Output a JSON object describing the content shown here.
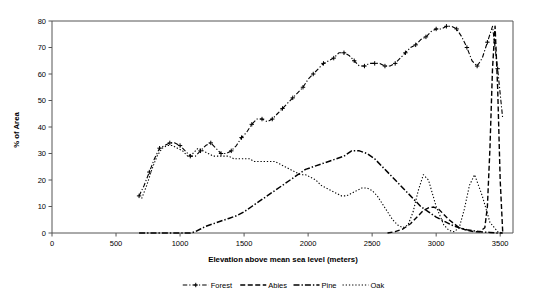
{
  "chart_data": {
    "type": "line",
    "title": "",
    "xlabel": "Elevation above mean sea level (meters)",
    "ylabel": "% of Area",
    "xlim": [
      0,
      3600
    ],
    "ylim": [
      0,
      80
    ],
    "xticks": [
      0,
      500,
      1000,
      1500,
      2000,
      2500,
      3000,
      3500
    ],
    "yticks": [
      0,
      10,
      20,
      30,
      40,
      50,
      60,
      70,
      80
    ],
    "xtick_labels": [
      "0",
      "500",
      "1000",
      "1500",
      "2000",
      "2500",
      "3000",
      "3500"
    ],
    "ytick_labels": [
      "0",
      "10",
      "20",
      "30",
      "40",
      "50",
      "60",
      "70",
      "80"
    ],
    "grid": false,
    "legend_position": "bottom",
    "series": [
      {
        "name": "Forest",
        "style": "dash-dot-marker",
        "marker": "plus",
        "color": "#000000",
        "x": [
          680,
          720,
          760,
          800,
          840,
          880,
          920,
          960,
          1000,
          1040,
          1080,
          1120,
          1160,
          1200,
          1240,
          1280,
          1320,
          1360,
          1400,
          1440,
          1480,
          1520,
          1560,
          1600,
          1640,
          1680,
          1720,
          1760,
          1800,
          1840,
          1880,
          1920,
          1960,
          2000,
          2040,
          2080,
          2120,
          2160,
          2200,
          2240,
          2280,
          2320,
          2360,
          2400,
          2440,
          2480,
          2520,
          2560,
          2600,
          2640,
          2680,
          2720,
          2760,
          2800,
          2840,
          2880,
          2920,
          2960,
          3000,
          3040,
          3080,
          3120,
          3160,
          3200,
          3240,
          3280,
          3320,
          3360,
          3400,
          3440,
          3480,
          3520
        ],
        "y": [
          14,
          18,
          23,
          28,
          32,
          33,
          34,
          34,
          33,
          31,
          29,
          29,
          31,
          33,
          34,
          32,
          30,
          30,
          31,
          33,
          36,
          38,
          41,
          43,
          43,
          42,
          43,
          45,
          47,
          49,
          51,
          53,
          55,
          58,
          60,
          62,
          64,
          65,
          66,
          68,
          68,
          67,
          65,
          63,
          63,
          64,
          64,
          64,
          63,
          63,
          64,
          66,
          68,
          70,
          71,
          73,
          74,
          76,
          77,
          77,
          78,
          78,
          77,
          74,
          70,
          65,
          63,
          66,
          72,
          78,
          62,
          43
        ]
      },
      {
        "name": "Abies",
        "style": "dashed",
        "color": "#000000",
        "x": [
          2620,
          2680,
          2740,
          2800,
          2860,
          2900,
          2940,
          2980,
          3020,
          3060,
          3100,
          3140,
          3180,
          3240,
          3300,
          3340,
          3380,
          3400,
          3420,
          3440,
          3460,
          3480,
          3500,
          3520
        ],
        "y": [
          0,
          0.5,
          1.5,
          3.5,
          6.5,
          8.5,
          9.5,
          9.8,
          9,
          7,
          5,
          3.5,
          2,
          1,
          0.5,
          0.5,
          2,
          10,
          32,
          62,
          78,
          55,
          20,
          0
        ]
      },
      {
        "name": "Pine",
        "style": "dash-dot",
        "color": "#000000",
        "x": [
          680,
          760,
          840,
          920,
          1000,
          1080,
          1120,
          1160,
          1200,
          1260,
          1320,
          1380,
          1440,
          1500,
          1560,
          1620,
          1680,
          1740,
          1800,
          1860,
          1920,
          1980,
          2040,
          2100,
          2160,
          2220,
          2280,
          2340,
          2400,
          2460,
          2520,
          2580,
          2640,
          2700,
          2760,
          2820,
          2880,
          2940,
          3000,
          3060,
          3120,
          3180,
          3240,
          3300,
          3360,
          3420,
          3480,
          3520
        ],
        "y": [
          0,
          0,
          0,
          0,
          0,
          0,
          0.5,
          1.5,
          2.5,
          3.5,
          4.5,
          5.5,
          6.5,
          8,
          10,
          12,
          14,
          16,
          18,
          20,
          22,
          24,
          25,
          26,
          27,
          28,
          29,
          31,
          31,
          30,
          28,
          25,
          22,
          19,
          16,
          13,
          10,
          8,
          6,
          4.5,
          3,
          2,
          1.2,
          0.8,
          0.4,
          0.2,
          0,
          0
        ]
      },
      {
        "name": "Oak",
        "style": "dotted",
        "color": "#000000",
        "x": [
          700,
          740,
          780,
          820,
          860,
          900,
          940,
          980,
          1020,
          1060,
          1100,
          1140,
          1180,
          1220,
          1260,
          1300,
          1340,
          1380,
          1420,
          1460,
          1500,
          1540,
          1580,
          1620,
          1660,
          1700,
          1740,
          1780,
          1820,
          1860,
          1900,
          1940,
          1980,
          2020,
          2060,
          2100,
          2140,
          2180,
          2220,
          2260,
          2300,
          2340,
          2380,
          2420,
          2460,
          2500,
          2540,
          2580,
          2620,
          2660,
          2700,
          2740,
          2780,
          2820,
          2860,
          2900,
          2940,
          3000,
          3060,
          3100,
          3140,
          3180,
          3220,
          3260,
          3300,
          3360,
          3420,
          3480,
          3520
        ],
        "y": [
          13,
          18,
          24,
          29,
          32,
          33,
          33,
          32,
          31,
          29,
          30,
          32,
          31,
          30,
          29,
          29,
          29,
          29,
          28,
          28,
          28,
          28,
          27,
          27,
          27,
          27,
          27,
          26,
          25,
          24,
          23,
          22,
          22,
          21,
          20,
          18,
          17,
          16,
          15,
          14,
          14,
          15,
          16,
          17,
          17,
          16,
          14,
          11,
          8,
          5,
          3,
          2,
          3,
          8,
          16,
          22,
          20,
          10,
          3,
          1,
          0.5,
          2,
          9,
          18,
          22,
          14,
          4,
          0.5,
          0
        ]
      }
    ]
  },
  "legend": {
    "items": [
      {
        "label": "Forest"
      },
      {
        "label": "Abies"
      },
      {
        "label": "Pine"
      },
      {
        "label": "Oak"
      }
    ]
  }
}
